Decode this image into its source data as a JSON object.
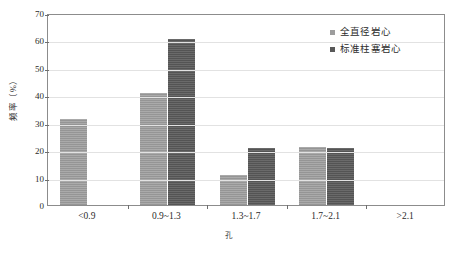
{
  "chart_data": {
    "type": "bar",
    "title": "",
    "xlabel": "孔",
    "ylabel": "频率（%）",
    "categories": [
      "<0.9",
      "0.9~1.3",
      "1.3~1.7",
      "1.7~2.1",
      ">2.1"
    ],
    "series": [
      {
        "name": "全直径岩心",
        "color": "#9d9d9d",
        "values": [
          31.3,
          40.9,
          10.9,
          21.2,
          0
        ]
      },
      {
        "name": "标准柱塞岩心",
        "color": "#595959",
        "values": [
          0,
          60.5,
          20.7,
          20.7,
          0
        ]
      }
    ],
    "ylim": [
      0,
      70
    ],
    "ytick_step": 10,
    "yticks": [
      0,
      10,
      20,
      30,
      40,
      50,
      60,
      70
    ],
    "grid": true,
    "grid_axis": "y",
    "legend_position": "top-right",
    "frame_color": "#8c8c8c",
    "grid_color": "#e2e2e2",
    "background": "#ffffff"
  },
  "axes": {
    "y_title": "频率（%）",
    "x_title": "孔"
  },
  "legend": {
    "items": [
      {
        "label": "全直径岩心",
        "color": "#9d9d9d"
      },
      {
        "label": "标准柱塞岩心",
        "color": "#595959"
      }
    ]
  }
}
